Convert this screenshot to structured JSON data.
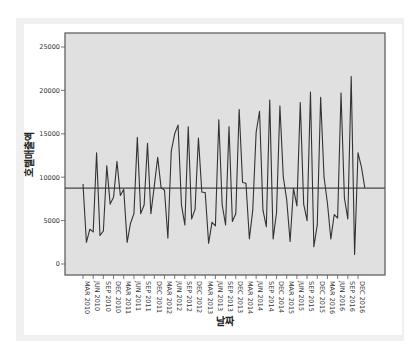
{
  "chart_data": {
    "type": "line",
    "title": "",
    "xlabel": "날짜",
    "ylabel": "호텔매출액",
    "ylim": [
      -1000,
      26000
    ],
    "yticks": [
      0,
      5000,
      10000,
      15000,
      20000,
      25000
    ],
    "ytick_labels": [
      "0",
      "5000",
      "10000",
      "15000",
      "20000",
      "25000"
    ],
    "xtick_labels": [
      "MAR 2010",
      "JUN 2010",
      "SEP 2010",
      "DEC 2010",
      "MAR 2011",
      "JUN 2011",
      "SEP 2011",
      "DEC 2011",
      "MAR 2012",
      "JUN 2012",
      "SEP 2012",
      "DEC 2012",
      "MAR 2013",
      "JUN 2013",
      "SEP 2013",
      "DEC 2013",
      "MAR 2014",
      "JUN 2014",
      "SEP 2014",
      "DEC 2014",
      "MAR 2015",
      "JUN 2015",
      "SEP 2015",
      "DEC 2015",
      "MAR 2016",
      "JUN 2016",
      "SEP 2016",
      "DEC 2016"
    ],
    "x_start": "MAR 2010",
    "x_step": "month",
    "reference_line": 8750,
    "grid": false,
    "series": [
      {
        "name": "호텔매출액",
        "color": "#333333",
        "values": [
          9200,
          2500,
          4000,
          3700,
          12800,
          3300,
          3800,
          11300,
          6900,
          7700,
          11800,
          7900,
          8600,
          2500,
          4700,
          5800,
          14600,
          5800,
          6800,
          13900,
          5800,
          9000,
          12300,
          8800,
          8500,
          3000,
          13000,
          15000,
          16000,
          6800,
          4500,
          15800,
          5200,
          6300,
          14500,
          8300,
          8200,
          2400,
          4800,
          4400,
          16600,
          6800,
          4500,
          15800,
          4900,
          5800,
          17800,
          9400,
          9300,
          2900,
          6200,
          15200,
          17600,
          6200,
          4300,
          18900,
          2900,
          5900,
          18200,
          10000,
          7400,
          2600,
          8700,
          6700,
          18600,
          6900,
          5000,
          19800,
          2000,
          4500,
          19200,
          10000,
          7000,
          2900,
          5700,
          5300,
          19700,
          7600,
          5200,
          21600,
          1100,
          12800,
          11200,
          8800
        ]
      }
    ],
    "colors": {
      "plot_background": "#e0e0e0",
      "frame": "#555555",
      "line": "#333333",
      "reference_line": "#444444"
    }
  }
}
